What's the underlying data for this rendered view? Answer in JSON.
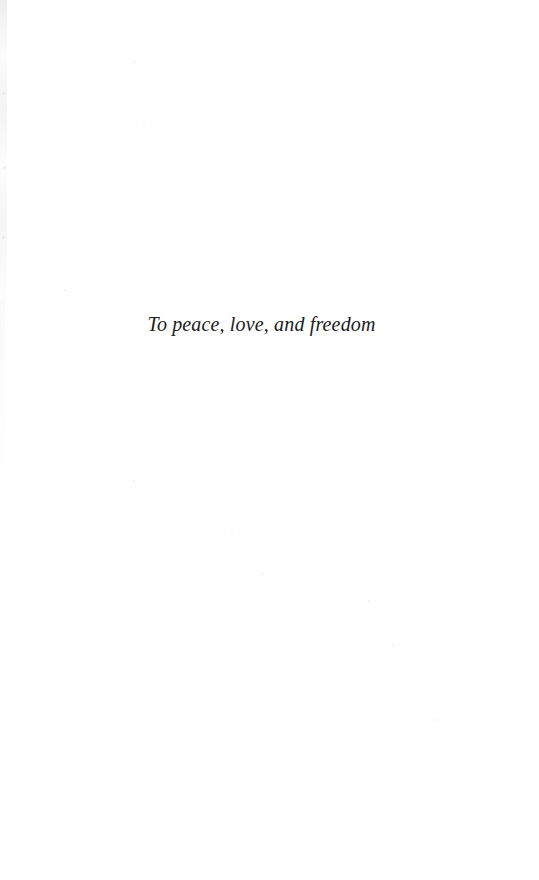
{
  "page": {
    "kind": "book-dedication-page",
    "background_color": "#ffffff",
    "width": 539,
    "height": 880
  },
  "dedication": {
    "text": "To peace, love, and freedom",
    "text_color": "#1b1b1b",
    "style": "serif-italic",
    "alignment": "center"
  },
  "artifacts": {
    "left_scan_edge_color": "#b4b4b4",
    "speckles": [
      {
        "x": 133,
        "y": 61,
        "size": 2
      },
      {
        "x": 2,
        "y": 92,
        "size": 3
      },
      {
        "x": 143,
        "y": 124,
        "size": 2
      },
      {
        "x": 3,
        "y": 166,
        "size": 3
      },
      {
        "x": 2,
        "y": 236,
        "size": 3
      },
      {
        "x": 64,
        "y": 289,
        "size": 2
      },
      {
        "x": 133,
        "y": 480,
        "size": 2
      },
      {
        "x": 231,
        "y": 532,
        "size": 2
      },
      {
        "x": 261,
        "y": 573,
        "size": 2
      },
      {
        "x": 368,
        "y": 600,
        "size": 2
      },
      {
        "x": 392,
        "y": 644,
        "size": 2
      },
      {
        "x": 434,
        "y": 719,
        "size": 2
      }
    ]
  }
}
